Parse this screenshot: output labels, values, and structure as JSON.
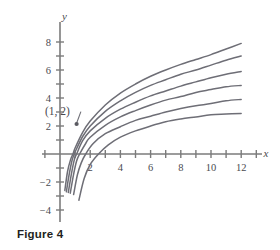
{
  "figure": {
    "caption": "Figure 4"
  },
  "chart_data": {
    "type": "line",
    "title": "",
    "xlabel": "x",
    "ylabel": "y",
    "xlim": [
      -1.2,
      13.2
    ],
    "ylim": [
      -4.8,
      8.8
    ],
    "grid": false,
    "legend": false,
    "x_ticks": [
      -1,
      1,
      2,
      3,
      4,
      5,
      6,
      7,
      8,
      9,
      10,
      11,
      12,
      13
    ],
    "x_tick_labels": [
      "",
      "",
      "2",
      "",
      "4",
      "",
      "6",
      "",
      "8",
      "",
      "10",
      "",
      "12",
      ""
    ],
    "y_ticks": [
      -4,
      -3,
      -2,
      -1,
      1,
      2,
      3,
      4,
      5,
      6,
      7,
      8
    ],
    "y_tick_labels": [
      "-4",
      "",
      "-2",
      "",
      "",
      "2",
      "",
      "4",
      "",
      "6",
      "",
      "8"
    ],
    "annotations": [
      {
        "text": "(1, 2)",
        "point_x": 1,
        "point_y": 2,
        "label_x": -1.0,
        "label_y": 3.1
      }
    ],
    "series": [
      {
        "name": "curve-1",
        "endpoint_x": 12,
        "endpoint_y": 7.9,
        "x_intercept": 0.86,
        "points_x": [
          0.32,
          0.5,
          0.7,
          0.86,
          1.0,
          1.5,
          2,
          3,
          4,
          5,
          6,
          7,
          8,
          9,
          10,
          11,
          12
        ],
        "points_y": [
          -2.6,
          -1.25,
          -0.4,
          0.0,
          0.43,
          1.55,
          2.35,
          3.5,
          4.35,
          5.0,
          5.55,
          6.0,
          6.4,
          6.75,
          7.1,
          7.5,
          7.9
        ]
      },
      {
        "name": "curve-2",
        "endpoint_x": 12,
        "endpoint_y": 7.0,
        "x_intercept": 0.95,
        "points_x": [
          0.42,
          0.6,
          0.8,
          0.95,
          1.0,
          1.5,
          2,
          3,
          4,
          5,
          6,
          7,
          8,
          9,
          10,
          11,
          12
        ],
        "points_y": [
          -2.7,
          -1.5,
          -0.45,
          0.0,
          0.15,
          1.25,
          2.0,
          3.05,
          3.8,
          4.4,
          4.9,
          5.3,
          5.7,
          6.0,
          6.35,
          6.7,
          7.0
        ]
      },
      {
        "name": "curve-3",
        "endpoint_x": 12,
        "endpoint_y": 5.9,
        "x_intercept": 1.1,
        "points_x": [
          0.55,
          0.75,
          0.95,
          1.1,
          1.5,
          2,
          3,
          4,
          5,
          6,
          7,
          8,
          9,
          10,
          11,
          12
        ],
        "points_y": [
          -2.75,
          -1.45,
          -0.4,
          0.0,
          0.95,
          1.65,
          2.55,
          3.2,
          3.7,
          4.15,
          4.5,
          4.85,
          5.15,
          5.45,
          5.7,
          5.9
        ]
      },
      {
        "name": "curve-4",
        "endpoint_x": 12,
        "endpoint_y": 4.9,
        "x_intercept": 1.3,
        "points_x": [
          0.68,
          0.9,
          1.1,
          1.3,
          1.7,
          2,
          3,
          4,
          5,
          6,
          7,
          8,
          9,
          10,
          11,
          12
        ],
        "points_y": [
          -2.8,
          -1.45,
          -0.5,
          0.0,
          0.75,
          1.2,
          2.05,
          2.65,
          3.1,
          3.5,
          3.85,
          4.1,
          4.4,
          4.6,
          4.8,
          4.9
        ]
      },
      {
        "name": "curve-5",
        "endpoint_x": 12,
        "endpoint_y": 3.9,
        "x_intercept": 1.7,
        "points_x": [
          0.9,
          1.15,
          1.4,
          1.7,
          2.2,
          3,
          4,
          5,
          6,
          7,
          8,
          9,
          10,
          11,
          12
        ],
        "points_y": [
          -2.9,
          -1.5,
          -0.65,
          0.0,
          0.75,
          1.45,
          1.95,
          2.4,
          2.7,
          3.0,
          3.25,
          3.45,
          3.6,
          3.8,
          3.9
        ]
      },
      {
        "name": "curve-6",
        "endpoint_x": 12,
        "endpoint_y": 2.9,
        "x_intercept": 2.55,
        "points_x": [
          1.25,
          1.6,
          2.0,
          2.55,
          3.2,
          4,
          5,
          6,
          7,
          8,
          9,
          10,
          11,
          12
        ],
        "points_y": [
          -3.3,
          -1.75,
          -0.75,
          0.0,
          0.65,
          1.2,
          1.65,
          2.0,
          2.3,
          2.5,
          2.65,
          2.8,
          2.85,
          2.9
        ]
      }
    ]
  }
}
